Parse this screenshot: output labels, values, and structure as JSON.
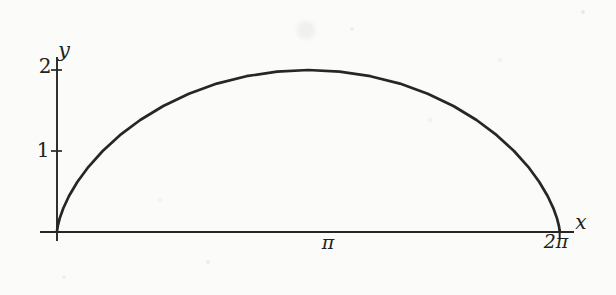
{
  "figure": {
    "kind": "scanned textbook plot of one cycloid arch",
    "background": "#fbfbf9",
    "ink": "#262626"
  },
  "chart_data": {
    "type": "line",
    "title": "",
    "curve_description": "cycloid arch x = t - sin t, y = 1 - cos t for t in [0, 2pi]; starts at origin, peaks at (pi, 2), returns to axis at (2pi, 0) with vertical cusps at both ends",
    "xlabel": "x",
    "ylabel": "y",
    "xlim": [
      0,
      6.2832
    ],
    "ylim": [
      0,
      2
    ],
    "grid": false,
    "legend": null,
    "xticks": [
      {
        "value": 3.1416,
        "label": "π",
        "tick_mark": false
      },
      {
        "value": 6.2832,
        "label": "2π",
        "tick_mark": true
      }
    ],
    "yticks": [
      {
        "value": 1,
        "label": "1",
        "tick_mark": true
      },
      {
        "value": 2,
        "label": "2",
        "tick_mark": true
      }
    ],
    "points": [
      [
        0.0,
        0.0
      ],
      [
        0.0013,
        0.0192
      ],
      [
        0.01,
        0.0761
      ],
      [
        0.0335,
        0.1685
      ],
      [
        0.0783,
        0.2929
      ],
      [
        0.1503,
        0.4444
      ],
      [
        0.2541,
        0.6173
      ],
      [
        0.3937,
        0.8049
      ],
      [
        0.5708,
        1.0
      ],
      [
        0.7864,
        1.1951
      ],
      [
        1.0396,
        1.3827
      ],
      [
        1.3284,
        1.5556
      ],
      [
        1.6491,
        1.7071
      ],
      [
        1.997,
        1.8315
      ],
      [
        2.3662,
        1.9239
      ],
      [
        2.7501,
        1.9808
      ],
      [
        3.1416,
        2.0
      ],
      [
        3.533,
        1.9808
      ],
      [
        3.917,
        1.9239
      ],
      [
        4.2862,
        1.8315
      ],
      [
        4.6341,
        1.7071
      ],
      [
        4.9548,
        1.5556
      ],
      [
        5.2436,
        1.3827
      ],
      [
        5.4968,
        1.1951
      ],
      [
        5.7124,
        1.0
      ],
      [
        5.8895,
        0.8049
      ],
      [
        6.0291,
        0.6173
      ],
      [
        6.1329,
        0.4444
      ],
      [
        6.2049,
        0.2929
      ],
      [
        6.2497,
        0.1685
      ],
      [
        6.2732,
        0.0761
      ],
      [
        6.2819,
        0.0192
      ],
      [
        6.2832,
        0.0
      ]
    ]
  }
}
